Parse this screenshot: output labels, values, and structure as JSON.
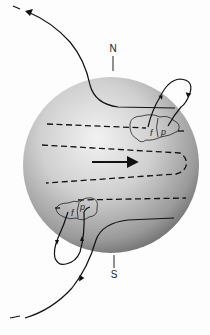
{
  "diagram": {
    "type": "solar-magnetic-field-diagram",
    "poles": {
      "north": "N",
      "south": "S"
    },
    "sunspot_groups": [
      {
        "hemisphere": "north",
        "leading_label": "p",
        "following_label": "f"
      },
      {
        "hemisphere": "south",
        "leading_label": "p",
        "following_label": "f"
      }
    ],
    "rotation_arrow": "rotation-direction-arrow",
    "colors": {
      "sphere_light": "#efefef",
      "sphere_mid": "#b5b5b5",
      "sphere_dark": "#6a6a6a",
      "line": "#111111",
      "background": "#fdfdfd"
    }
  }
}
